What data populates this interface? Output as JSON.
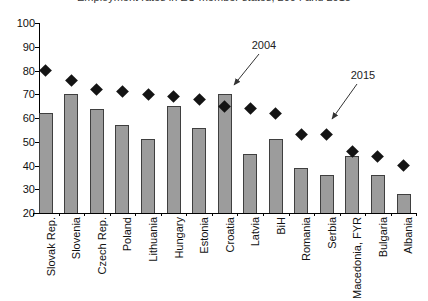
{
  "chart_data": {
    "type": "bar",
    "title": "Employment rates in EU member states, 2004 and 2015",
    "title_visibility": "clipped at top edge of image",
    "categories": [
      "Slovak Rep.",
      "Slovenia",
      "Czech Rep.",
      "Poland",
      "Lithuania",
      "Hungary",
      "Estonia",
      "Croatia",
      "Latvia",
      "BiH",
      "Romania",
      "Serbia",
      "Macedonia, FYR",
      "Bulgaria",
      "Albania"
    ],
    "series": [
      {
        "name": "2004",
        "style": "bar",
        "values": [
          62,
          70,
          64,
          57,
          51,
          65,
          56,
          70,
          45,
          51,
          39,
          36,
          44,
          36,
          28
        ]
      },
      {
        "name": "2015",
        "style": "diamond-marker",
        "values": [
          80,
          76,
          72,
          71,
          70,
          69,
          68,
          65,
          64,
          62,
          53,
          53,
          46,
          44,
          40
        ]
      }
    ],
    "ylim": [
      20,
      100
    ],
    "yticks": [
      100,
      90,
      80,
      70,
      60,
      50,
      40,
      30,
      20
    ],
    "grid": false,
    "legend": "none",
    "annotations": [
      {
        "label": "2004",
        "points_to": "Croatia bar"
      },
      {
        "label": "2015",
        "points_to": "Serbia diamond"
      }
    ]
  },
  "colors": {
    "bar_fill": "#9c9c9c",
    "bar_border": "#3f3f3f",
    "diamond": "#141414",
    "axis": "#000000",
    "arrow": "#333333",
    "text": "#111111"
  }
}
